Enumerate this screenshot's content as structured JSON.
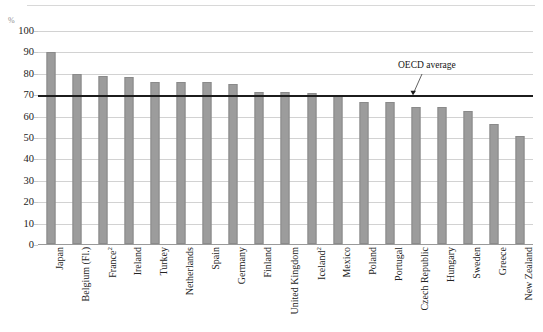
{
  "figure": {
    "top_caption": "",
    "unit_label": "%",
    "annotation": {
      "text": "OECD average",
      "value": 70
    }
  },
  "chart_data": {
    "type": "bar",
    "title": "",
    "subtitle": "",
    "xlabel": "",
    "ylabel": "%",
    "ylim": [
      0,
      100
    ],
    "ytick_step": 10,
    "yticks": [
      0,
      10,
      20,
      30,
      40,
      50,
      60,
      70,
      80,
      90,
      100
    ],
    "ytick_labels": [
      "0",
      "10",
      "20",
      "30",
      "40",
      "50",
      "60",
      "70",
      "80",
      "90",
      "100"
    ],
    "grid": true,
    "grid_axis": "y",
    "legend": false,
    "legend_position": "none",
    "bar_color": "#9c9c9c",
    "reference_line": {
      "label": "OECD average",
      "value": 70,
      "color": "#1c1c1c"
    },
    "categories": [
      "Japan",
      "Belgium (Fl.)",
      "France",
      "Ireland",
      "Turkey",
      "Netherlands",
      "Spain",
      "Germany",
      "Finland",
      "United Kingdom",
      "Iceland",
      "Mexico",
      "Poland",
      "Portugal",
      "Czech Republic",
      "Hungary",
      "Sweden",
      "Greece",
      "New Zealand"
    ],
    "category_footnotes": [
      "",
      "",
      "2",
      "",
      "",
      "",
      "",
      "",
      "",
      "",
      "2",
      "",
      "",
      "",
      "",
      "",
      "",
      "",
      ""
    ],
    "values": [
      89.5,
      79.5,
      78.5,
      78.0,
      75.5,
      75.5,
      75.5,
      75.0,
      71.0,
      71.0,
      70.5,
      69.0,
      66.5,
      66.5,
      64.0,
      64.0,
      62.0,
      56.0,
      50.5
    ]
  }
}
